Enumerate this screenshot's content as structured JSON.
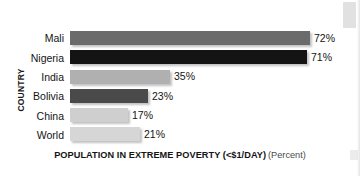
{
  "chart_data": {
    "type": "bar",
    "orientation": "horizontal",
    "title": "",
    "xlabel": "POPULATION IN EXTREME POVERTY (<$1/DAY)",
    "xlabel_unit": "(Percent)",
    "ylabel": "COUNTRY",
    "categories": [
      "Mali",
      "Nigeria",
      "India",
      "Bolivia",
      "China",
      "World"
    ],
    "values": [
      72,
      71,
      35,
      23,
      17,
      21
    ],
    "value_labels": [
      "72%",
      "71%",
      "35%",
      "23%",
      "17%",
      "21%"
    ],
    "bar_colors": [
      "#6b6b6b",
      "#141414",
      "#b0b0b0",
      "#4a4a4a",
      "#cfcfcf",
      "#d6d6d6"
    ],
    "bar_pixel_lengths": [
      240,
      237,
      100,
      78,
      58,
      70
    ],
    "xlim": [
      0,
      80
    ],
    "grid": false,
    "legend": false
  }
}
